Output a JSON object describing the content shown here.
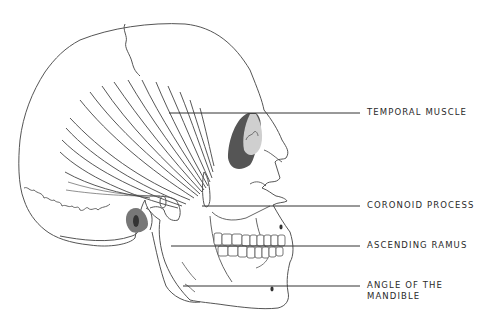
{
  "figure": {
    "colors": {
      "outline": "#555555",
      "leader_line": "#333333",
      "shade_light": "#cfcfcf",
      "shade_dark": "#555555",
      "label_text": "#2a2a2a"
    }
  },
  "labels": [
    {
      "id": "temporal-muscle",
      "text": "TEMPORAL MUSCLE",
      "line_y": 113,
      "line_x_start": 169,
      "line_x_end": 360
    },
    {
      "id": "coronoid-process",
      "text": "CORONOID PROCESS",
      "line_y": 206,
      "line_x_start": 202,
      "line_x_end": 360
    },
    {
      "id": "ascending-ramus",
      "text": "ASCENDING RAMUS",
      "line_y": 246,
      "line_x_start": 171,
      "line_x_end": 360
    },
    {
      "id": "angle-of-mandible",
      "text_line1": "ANGLE OF THE",
      "text_line2": "MANDIBLE",
      "line_y": 286,
      "line_x_start": 183,
      "line_x_end": 360
    }
  ]
}
